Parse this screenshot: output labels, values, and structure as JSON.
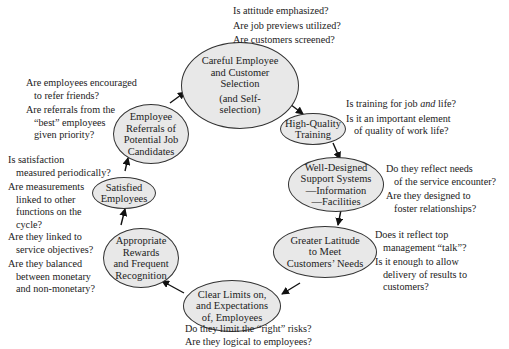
{
  "nodes": {
    "selection": {
      "lines": [
        "Careful Employee",
        "and Customer",
        "Selection",
        "(and Self-",
        "selection)"
      ]
    },
    "training": {
      "lines": [
        "High-Quality",
        "Training"
      ]
    },
    "support": {
      "lines": [
        "Well-Designed",
        "Support Systems",
        "—Information",
        "—Facilities"
      ]
    },
    "latitude": {
      "lines": [
        "Greater Latitude",
        "to Meet",
        "Customers’ Needs"
      ]
    },
    "limits": {
      "lines": [
        "Clear Limits on,",
        "and Expectations",
        "of, Employees"
      ]
    },
    "rewards": {
      "lines": [
        "Appropriate",
        "Rewards",
        "and Frequent",
        "Recognition"
      ]
    },
    "satisfied": {
      "lines": [
        "Satisfied",
        "Employees"
      ]
    },
    "referrals": {
      "lines": [
        "Employee",
        "Referrals of",
        "Potential Job",
        "Candidates"
      ]
    }
  },
  "questions": {
    "selection": [
      [
        "Is attitude emphasized?"
      ],
      [
        "Are job previews utilized?"
      ],
      [
        "Are customers screened?"
      ]
    ],
    "training": [
      [
        "Is training for job ",
        "and",
        " life?"
      ],
      [
        "Is it an important element",
        "of quality of work life?"
      ]
    ],
    "support": [
      [
        "Do they reflect needs",
        "of the service encounter?"
      ],
      [
        "Are they designed to",
        "foster relationships?"
      ]
    ],
    "latitude": [
      [
        "Does it reflect top",
        "management “talk”?"
      ],
      [
        "Is it enough to allow",
        "delivery of results to",
        "customers?"
      ]
    ],
    "limits": [
      [
        "Do they limit the “right” risks?"
      ],
      [
        "Are they logical to employees?"
      ]
    ],
    "rewards": [
      [
        "Are they linked to",
        "service objectives?"
      ],
      [
        "Are they balanced",
        "between monetary",
        "and non-monetary?"
      ]
    ],
    "satisfied": [
      [
        "Is satisfaction",
        "measured periodically?"
      ],
      [
        "Are measurements",
        "linked to other",
        "functions on the",
        "cycle?"
      ]
    ],
    "referrals": [
      [
        "Are employees encouraged",
        "to refer friends?"
      ],
      [
        "Are referrals from the",
        "“best” employees",
        "given priority?"
      ]
    ]
  },
  "colors": {
    "node_fill": "#e8e8e8",
    "stroke": "#333333"
  }
}
